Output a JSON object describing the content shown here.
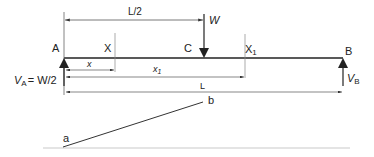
{
  "diagram": {
    "beam": {
      "left_end_label": "A",
      "right_end_label": "B",
      "load_point_label": "C",
      "section_label": "X",
      "section1_label": "X",
      "section1_sub": "1"
    },
    "load": {
      "label": "W"
    },
    "reactions": {
      "left": {
        "label": "V",
        "sub": "A",
        "value": "= W/2"
      },
      "right": {
        "label": "V",
        "sub": "B"
      }
    },
    "dimensions": {
      "half_span": "L/2",
      "x": "x",
      "x1": "x",
      "x1_sub": "1",
      "span": "L"
    },
    "moment_diagram": {
      "start_label": "a",
      "end_label": "b"
    },
    "colors": {
      "line": "#222222",
      "dim_line": "#555555",
      "baseline": "#bbbbbb"
    }
  }
}
